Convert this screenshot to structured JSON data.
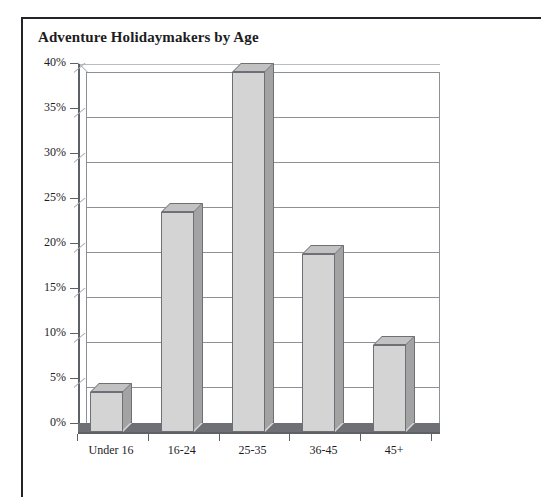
{
  "page": {
    "border_color": "#222428",
    "background": "#ffffff"
  },
  "chart_data": {
    "type": "bar",
    "title": "Adventure Holidaymakers by Age",
    "xlabel": "",
    "ylabel": "",
    "categories": [
      "Under 16",
      "16-24",
      "25-35",
      "36-45",
      "45+"
    ],
    "values": [
      4.5,
      24.5,
      40,
      19.8,
      9.7
    ],
    "ylim": [
      0,
      40
    ],
    "ytick_labels": [
      "0%",
      "5%",
      "10%",
      "15%",
      "20%",
      "25%",
      "30%",
      "35%",
      "40%"
    ],
    "ytick_values": [
      0,
      5,
      10,
      15,
      20,
      25,
      30,
      35,
      40
    ],
    "grid": true,
    "legend": false,
    "style": "3d-column",
    "colors": {
      "bar_front": "#d4d4d4",
      "bar_side": "#a3a3a3",
      "bar_top": "#c2c2c2",
      "bar_outline": "#6e7075",
      "floor": "#6e7075",
      "gridline": "#8d9095",
      "axis": "#5d6065",
      "text": "#1d1d1f"
    }
  }
}
